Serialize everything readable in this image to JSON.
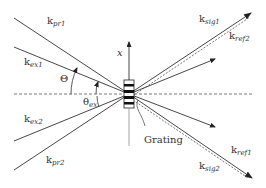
{
  "diagram": {
    "type": "wave-vector geometry",
    "colors": {
      "line": "#333333",
      "dash": "#555555",
      "background": "#ffffff"
    },
    "center": {
      "x": 129,
      "y": 94
    },
    "axis_label": "x",
    "grating_label": "Grating",
    "angles": {
      "big": {
        "symbol": "Θ"
      },
      "small": {
        "symbol": "θ",
        "subscript": "ex"
      }
    },
    "vectors": {
      "kpr1": {
        "base": "k",
        "subscript": "pr1"
      },
      "kex1": {
        "base": "k",
        "subscript": "ex1"
      },
      "kex2": {
        "base": "k",
        "subscript": "ex2"
      },
      "kpr2": {
        "base": "k",
        "subscript": "pr2"
      },
      "ksig1": {
        "base": "k",
        "subscript": "sig1"
      },
      "kref2": {
        "base": "k",
        "subscript": "ref2"
      },
      "kref1": {
        "base": "k",
        "subscript": "ref1"
      },
      "ksig2": {
        "base": "k",
        "subscript": "sig2"
      }
    }
  }
}
